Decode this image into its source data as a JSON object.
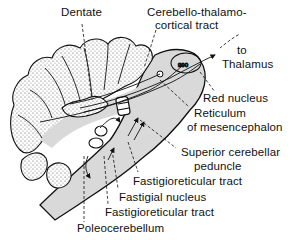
{
  "diagram": {
    "colors": {
      "ink": "#111111",
      "shading": "#d9d9d9",
      "background": "#ffffff"
    },
    "labels": {
      "dentate": "Dentate",
      "cerebello_thalamo_1": "Cerebello-thalamo-",
      "cerebello_thalamo_2": "cortical tract",
      "to_thalamus_1": "to",
      "to_thalamus_2": "Thalamus",
      "red_nucleus": "Red nucleus",
      "reticulum_1": "Reticulum",
      "reticulum_2": "of mesencephalon",
      "superior_peduncle_1": "Superior cerebellar",
      "superior_peduncle_2": "peduncle",
      "fastigioreticular_upper": "Fastigioreticular tract",
      "fastigial_nucleus": "Fastigial nucleus",
      "fastigioreticular_lower": "Fastigioreticular tract",
      "poleocerebellum": "Poleocerebellum"
    }
  }
}
